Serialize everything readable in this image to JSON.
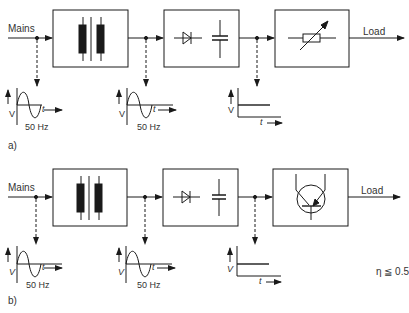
{
  "diagrams": [
    {
      "id": "a",
      "caption": "a)",
      "input_label": "Mains",
      "output_label": "Load",
      "blocks": [
        {
          "name": "transformer",
          "icon": "transformer-icon"
        },
        {
          "name": "rectifier-filter",
          "icon": "diode-capacitor-icon"
        },
        {
          "name": "variable-resistor-regulator",
          "icon": "variable-resistor-icon"
        }
      ],
      "waveforms": [
        {
          "type": "sine",
          "v_label": "V",
          "t_label": "t",
          "freq_label": "50 Hz"
        },
        {
          "type": "sine",
          "v_label": "V",
          "t_label": "t",
          "freq_label": "50 Hz"
        },
        {
          "type": "dc",
          "v_label": "V",
          "t_label": "t"
        }
      ]
    },
    {
      "id": "b",
      "caption": "b)",
      "input_label": "Mains",
      "output_label": "Load",
      "blocks": [
        {
          "name": "transformer",
          "icon": "transformer-icon"
        },
        {
          "name": "rectifier-filter",
          "icon": "diode-capacitor-icon"
        },
        {
          "name": "transistor-regulator",
          "icon": "transistor-icon"
        }
      ],
      "waveforms": [
        {
          "type": "sine",
          "v_label": "V",
          "t_label": "t",
          "freq_label": "50 Hz"
        },
        {
          "type": "sine",
          "v_label": "V",
          "t_label": "t",
          "freq_label": "50 Hz"
        },
        {
          "type": "dc",
          "v_label": "V",
          "t_label": "t"
        }
      ],
      "efficiency_note": "η ≦ 0.5"
    }
  ]
}
